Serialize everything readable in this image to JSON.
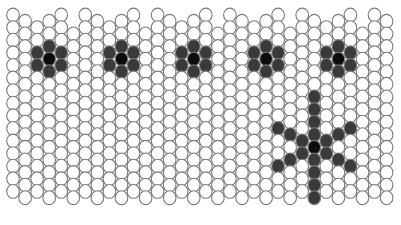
{
  "colors": {
    "background": "#ffffff",
    "bead_outline": "#7a7a7a",
    "bead_empty": "#ffffff",
    "bead_petal": "#3a3a3a",
    "bead_core": "#0c0c0c"
  },
  "grid": {
    "columns": 32,
    "x_start": 13,
    "col_pitch": 12.05,
    "row_pitch": 12.6,
    "bead_rx": 6.3,
    "bead_ry": 6.9,
    "even_col_top": 15,
    "odd_col_top": 21.3,
    "rows_even": 15,
    "rows_odd": 15,
    "top_skip": [
      0,
      0,
      1,
      0,
      0,
      1,
      0,
      0,
      1,
      0,
      0,
      1,
      0,
      0,
      1,
      0,
      0,
      1,
      0,
      0,
      1,
      0,
      0,
      1,
      0,
      0,
      1,
      0,
      0,
      1,
      0,
      0
    ]
  },
  "motifs": {
    "flowers": [
      {
        "col": 3,
        "row": 3
      },
      {
        "col": 9,
        "row": 3
      },
      {
        "col": 15,
        "row": 3
      },
      {
        "col": 21,
        "row": 3
      },
      {
        "col": 27,
        "row": 3
      }
    ],
    "snowflake": {
      "col": 25,
      "row": 10,
      "arm_length": 4,
      "diag_length": 3
    }
  }
}
